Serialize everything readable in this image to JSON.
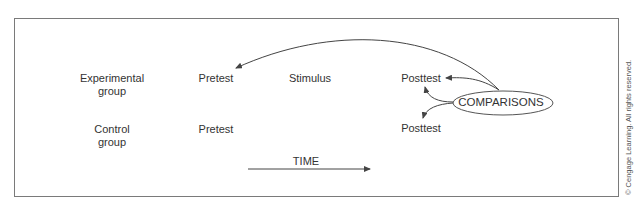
{
  "diagram": {
    "rows": [
      {
        "group": "Experimental group",
        "group_line1": "Experimental",
        "group_line2": "group",
        "pretest": "Pretest",
        "stimulus": "Stimulus",
        "posttest": "Posttest"
      },
      {
        "group": "Control group",
        "group_line1": "Control",
        "group_line2": "group",
        "pretest": "Pretest",
        "stimulus": "",
        "posttest": "Posttest"
      }
    ],
    "comparisons_label": "COMPARISONS",
    "time_label": "TIME",
    "copyright": "© Cengage Learning. All rights reserved.",
    "colors": {
      "line": "#444444",
      "border": "#7a7a7a",
      "text": "#333333"
    }
  }
}
